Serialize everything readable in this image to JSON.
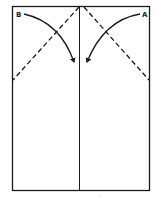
{
  "diagram": {
    "type": "folding-instruction",
    "labels": {
      "left_corner": "B",
      "right_corner": "A"
    },
    "colors": {
      "stroke": "#1a1a1a",
      "background": "#ffffff"
    },
    "elements": [
      "rectangle outline",
      "vertical center crease",
      "dashed fold lines from top center to left and right edges",
      "curved arrow from B toward center",
      "curved arrow from A toward center"
    ],
    "footer_mark": "'"
  }
}
